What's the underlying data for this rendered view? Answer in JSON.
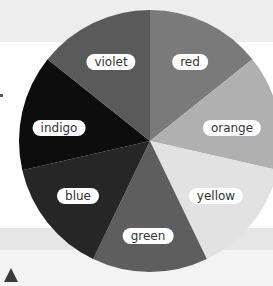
{
  "diagram": {
    "type": "color-wheel",
    "center": [
      150,
      141
    ],
    "radius": 131,
    "start_angle_deg": 0,
    "direction": "clockwise",
    "segments": [
      {
        "name": "red",
        "label": "red",
        "fill": "#7a7a7a",
        "label_pos": [
          190,
          62
        ]
      },
      {
        "name": "orange",
        "label": "orange",
        "fill": "#b0b0b0",
        "label_pos": [
          232,
          128
        ]
      },
      {
        "name": "yellow",
        "label": "yellow",
        "fill": "#e2e2e2",
        "label_pos": [
          216,
          196
        ]
      },
      {
        "name": "green",
        "label": "green",
        "fill": "#5e5e5e",
        "label_pos": [
          148,
          236
        ]
      },
      {
        "name": "blue",
        "label": "blue",
        "fill": "#262626",
        "label_pos": [
          78,
          196
        ]
      },
      {
        "name": "indigo",
        "label": "indigo",
        "fill": "#0d0d0d",
        "label_pos": [
          59,
          128
        ]
      },
      {
        "name": "violet",
        "label": "violet",
        "fill": "#5a5a5a",
        "label_pos": [
          111,
          62
        ]
      }
    ]
  },
  "chart_data": {
    "type": "pie",
    "categories": [
      "red",
      "orange",
      "yellow",
      "green",
      "blue",
      "indigo",
      "violet"
    ],
    "values": [
      1,
      1,
      1,
      1,
      1,
      1,
      1
    ],
    "title": "",
    "legend": "inline labels on slices"
  },
  "decorations": {
    "triangle_marker": "up-triangle"
  }
}
